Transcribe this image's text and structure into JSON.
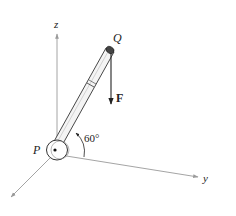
{
  "diagram": {
    "labels": {
      "z_axis": "z",
      "y_axis": "y",
      "point_p": "P",
      "point_q": "Q",
      "force": "F",
      "angle": "60°"
    },
    "colors": {
      "axis": "#9a9a9a",
      "ink": "#222222",
      "rod_fill": "#f4f4f4",
      "background": "#ffffff"
    },
    "geometry": {
      "angle_deg": 60
    }
  }
}
